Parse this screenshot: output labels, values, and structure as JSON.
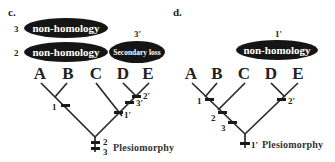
{
  "figure": {
    "panels": [
      {
        "id": "c",
        "label": "c.",
        "taxa": [
          "A",
          "B",
          "C",
          "D",
          "E"
        ],
        "ellipses": [
          {
            "number": "3",
            "text": "non-homology"
          },
          {
            "number": "2",
            "text": "non-homology"
          },
          {
            "number": "3'",
            "text": "Secondary loss"
          }
        ],
        "character_marks": {
          "ab_clade": "1",
          "de_clade": "2'",
          "cde_upper": "3'",
          "cde_lower": "1'",
          "root_upper": "2",
          "root_lower": "3"
        },
        "root_label": "Plesiomorphy"
      },
      {
        "id": "d",
        "label": "d.",
        "taxa": [
          "A",
          "B",
          "C",
          "D",
          "E"
        ],
        "ellipses": [
          {
            "number": "1'",
            "text": "non-homology"
          }
        ],
        "character_marks": {
          "ab_clade": "1",
          "abc_upper": "2",
          "abc_lower": "3",
          "de_clade": "2'",
          "root": "1'"
        },
        "root_label": "Plesiomorphy"
      }
    ]
  }
}
